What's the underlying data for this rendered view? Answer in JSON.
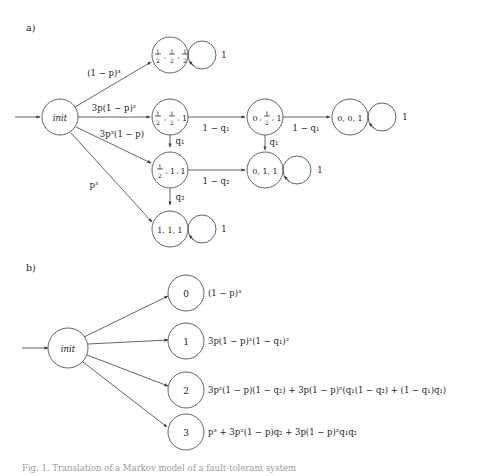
{
  "figure": {
    "panel_a": {
      "label": "a)",
      "init_node": "init",
      "nodes": [
        {
          "id": "half-half-half",
          "label": "½, ½, ½",
          "num": [
            "1",
            "1",
            "1"
          ],
          "den": [
            "2",
            "2",
            "2"
          ],
          "kind": "fractions3"
        },
        {
          "id": "half-half-one",
          "label": "½, ½, 1",
          "kind": "frac2-one"
        },
        {
          "id": "zero-half-one",
          "label": "0, ½, 1",
          "kind": "zero-frac-one"
        },
        {
          "id": "zero-zero-one",
          "label": "0, 0, 1",
          "kind": "plain"
        },
        {
          "id": "half-one-one",
          "label": "½, 1, 1",
          "kind": "frac1-one-one"
        },
        {
          "id": "zero-one-one",
          "label": "0, 1, 1",
          "kind": "plain"
        },
        {
          "id": "one-one-one",
          "label": "1, 1, 1",
          "kind": "plain"
        }
      ],
      "init_edges": [
        {
          "to": "half-half-half",
          "label": "(1 − p)³"
        },
        {
          "to": "half-half-one",
          "label": "3p(1 − p)²"
        },
        {
          "to": "half-one-one",
          "label": "3p²(1 − p)"
        },
        {
          "to": "one-one-one",
          "label": "p³"
        }
      ],
      "transitions": [
        {
          "from": "half-half-one",
          "to": "zero-half-one",
          "label": "1 − q₁"
        },
        {
          "from": "half-half-one",
          "to": "half-one-one",
          "label": "q₁"
        },
        {
          "from": "zero-half-one",
          "to": "zero-one-one",
          "label": "q₁"
        },
        {
          "from": "zero-half-one",
          "to": "zero-zero-one",
          "label": "1 − q₁"
        },
        {
          "from": "half-one-one",
          "to": "zero-one-one",
          "label": "1 − q₂"
        },
        {
          "from": "half-one-one",
          "to": "one-one-one",
          "label": "q₂"
        }
      ],
      "self_loops": [
        {
          "on": "half-half-half",
          "label": "1"
        },
        {
          "on": "zero-zero-one",
          "label": "1"
        },
        {
          "on": "zero-one-one",
          "label": "1"
        },
        {
          "on": "one-one-one",
          "label": "1"
        }
      ]
    },
    "panel_b": {
      "label": "b)",
      "init_node": "init",
      "outcomes": [
        {
          "node": "0",
          "formula": "(1 − p)³"
        },
        {
          "node": "1",
          "formula": "3p(1 − p)²(1 − q₁)²"
        },
        {
          "node": "2",
          "formula": "3p²(1 − p)(1 − q₂) + 3p(1 − p)²(q₁(1 − q₂) + (1 − q₁)q₁)"
        },
        {
          "node": "3",
          "formula": "p³ + 3p²(1 − p)q₂ + 3p(1 − p)²q₁q₂"
        }
      ]
    },
    "caption": "Fig. 1. Translation of a Markov model of a fault-tolerant system"
  },
  "colors": {
    "stroke": "#3c3c3c",
    "text": "#1a1a1a",
    "caption": "#9a9a9a",
    "background": "#ffffff"
  }
}
